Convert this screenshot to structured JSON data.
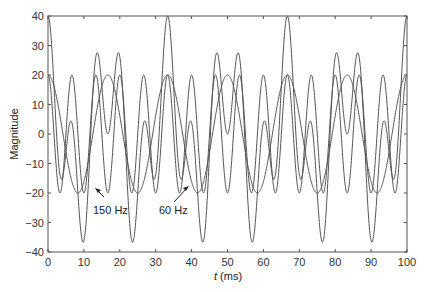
{
  "chart_data": {
    "type": "line",
    "title": "",
    "xlabel_italic": "t",
    "xlabel_rest": " (ms)",
    "xlabel": "t (ms)",
    "ylabel": "Magnitude",
    "xlim": [
      0,
      100
    ],
    "ylim": [
      -40,
      40
    ],
    "grid": false,
    "legend": "none",
    "x_ticks": [
      0,
      10,
      20,
      30,
      40,
      50,
      60,
      70,
      80,
      90,
      100
    ],
    "y_ticks": [
      -40,
      -30,
      -20,
      -10,
      0,
      10,
      20,
      30,
      40
    ],
    "x_tick_labels": [
      "0",
      "10",
      "20",
      "30",
      "40",
      "50",
      "60",
      "70",
      "80",
      "90",
      "100"
    ],
    "y_tick_labels": [
      "−40",
      "−30",
      "−20",
      "−10",
      "0",
      "10",
      "20",
      "30",
      "40"
    ],
    "series": [
      {
        "name": "60 Hz",
        "function": "20*cos(2*pi*0.06*t)",
        "amplitude": 20,
        "frequency_hz": 60,
        "x": [
          0,
          4.17,
          8.33,
          12.5,
          16.67,
          20.83,
          25,
          29.17,
          33.33,
          37.5,
          41.67,
          45.83,
          50,
          54.17,
          58.33,
          62.5,
          66.67,
          70.83,
          75,
          79.17,
          83.33,
          87.5,
          91.67,
          95.83,
          100
        ],
        "values": [
          20,
          0,
          -20,
          0,
          20,
          0,
          -20,
          0,
          20,
          0,
          -20,
          0,
          20,
          0,
          -20,
          0,
          20,
          0,
          -20,
          0,
          20,
          0,
          -20,
          0,
          20
        ]
      },
      {
        "name": "150 Hz",
        "function": "20*cos(2*pi*0.15*t)",
        "amplitude": 20,
        "frequency_hz": 150,
        "x": [
          0,
          3.33,
          6.67,
          10,
          13.33,
          16.67,
          20,
          23.33,
          26.67,
          30,
          33.33
        ],
        "values": [
          20,
          -20,
          20,
          -20,
          20,
          -20,
          20,
          -20,
          20,
          -20,
          20
        ]
      },
      {
        "name": "Sum (60 Hz + 150 Hz)",
        "function": "20*cos(2*pi*0.06*t)+20*cos(2*pi*0.15*t)",
        "x": [
          0,
          3.33,
          6.67,
          10,
          13.33,
          16.67,
          20,
          23.33,
          26.67,
          30,
          33.33,
          50,
          66.67,
          100
        ],
        "values": [
          40,
          -17,
          28,
          -36,
          27,
          0,
          13,
          -36,
          27,
          -17,
          40,
          0,
          40,
          40
        ]
      }
    ],
    "annotations": [
      {
        "text": "150 Hz",
        "points_to": "150 Hz trough near t=16.7 ms, y=-20"
      },
      {
        "text": "60 Hz",
        "points_to": "60 Hz trough near t=25 ms, y=-20"
      }
    ]
  },
  "render": {
    "plot": {
      "left": 48,
      "right": 407,
      "top": 16,
      "bottom": 252
    },
    "samples": 1200
  }
}
